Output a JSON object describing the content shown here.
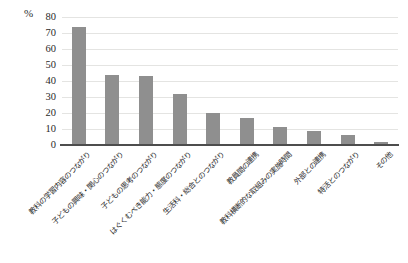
{
  "chart_data": {
    "type": "bar",
    "title": "",
    "unit_label": "%",
    "categories": [
      "教科の学習内容のつながり",
      "子どもの興味・関心のつながり",
      "子どもの思考のつながり",
      "はぐくむべき能力・態度のつながり",
      "生活科・総合とのつながり",
      "教員間の連携",
      "教科横断的な取組みの実施時間",
      "外部との連携",
      "特活とのつながり",
      "その他"
    ],
    "values": [
      74,
      44,
      43,
      32,
      20,
      17,
      11,
      9,
      6,
      2
    ],
    "xlabel": "",
    "ylabel": "%",
    "ylim": [
      0,
      80
    ],
    "ytick_step": 10,
    "grid": true,
    "legend": "none",
    "bar_color": "#8f8f8f",
    "gridline_color": "#e4e4e2",
    "axis_color": "#4d4d4d"
  }
}
